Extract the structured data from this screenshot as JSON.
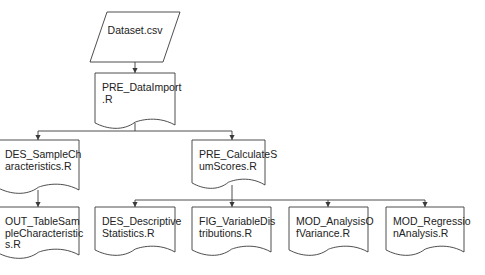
{
  "diagram": {
    "type": "flowchart",
    "nodes": [
      {
        "id": "dataset",
        "shape": "parallelogram",
        "lines": [
          "Dataset.csv"
        ]
      },
      {
        "id": "pre_dataimport",
        "shape": "document",
        "lines": [
          "PRE_DataImport",
          ".R"
        ]
      },
      {
        "id": "des_sample",
        "shape": "document",
        "lines": [
          "DES_SampleCh",
          "aracteristics.R"
        ]
      },
      {
        "id": "pre_calc",
        "shape": "document",
        "lines": [
          "PRE_CalculateS",
          "umScores.R"
        ]
      },
      {
        "id": "out_table",
        "shape": "document",
        "lines": [
          "OUT_TableSam",
          "pleCharacteristic",
          "s.R"
        ]
      },
      {
        "id": "des_desc",
        "shape": "document",
        "lines": [
          "DES_Descriptive",
          "Statistics.R"
        ]
      },
      {
        "id": "fig_var",
        "shape": "document",
        "lines": [
          "FIG_VariableDis",
          "tributions.R"
        ]
      },
      {
        "id": "mod_anova",
        "shape": "document",
        "lines": [
          "MOD_AnalysisO",
          "fVariance.R"
        ]
      },
      {
        "id": "mod_reg",
        "shape": "document",
        "lines": [
          "MOD_Regressio",
          "nAnalysis.R"
        ]
      }
    ],
    "edges": [
      {
        "from": "dataset",
        "to": "pre_dataimport"
      },
      {
        "from": "pre_dataimport",
        "to": "des_sample"
      },
      {
        "from": "pre_dataimport",
        "to": "pre_calc"
      },
      {
        "from": "des_sample",
        "to": "out_table"
      },
      {
        "from": "pre_calc",
        "to": "des_desc"
      },
      {
        "from": "pre_calc",
        "to": "fig_var"
      },
      {
        "from": "pre_calc",
        "to": "mod_anova"
      },
      {
        "from": "pre_calc",
        "to": "mod_reg"
      }
    ],
    "colors": {
      "stroke": "#3a3a3a",
      "text": "#222222",
      "background": "#ffffff"
    }
  }
}
